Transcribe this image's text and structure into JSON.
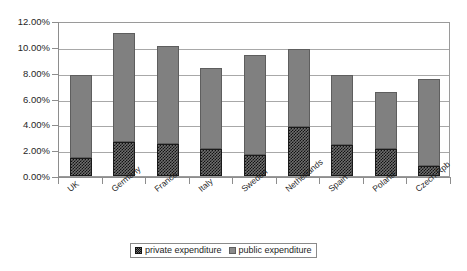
{
  "chart_data": {
    "type": "bar",
    "stacked": true,
    "title": "",
    "subtitle": "",
    "xlabel": "",
    "ylabel": "",
    "ylim": [
      0,
      12
    ],
    "ytick_labels": [
      "0.00%",
      "2.00%",
      "4.00%",
      "6.00%",
      "8.00%",
      "10.00%",
      "12.00%"
    ],
    "ytick_values": [
      0,
      2,
      4,
      6,
      8,
      10,
      12
    ],
    "grid": true,
    "legend_position": "bottom",
    "categories": [
      "UK",
      "Germany",
      "France",
      "Italy",
      "Sweden",
      "Netherlands",
      "Spain",
      "Poland",
      "Czech Rpb"
    ],
    "series": [
      {
        "name": "private expenditure",
        "color": "#1a1a1a",
        "pattern": "checkered",
        "values": [
          1.4,
          2.6,
          2.5,
          2.1,
          1.6,
          3.8,
          2.4,
          2.1,
          0.8
        ]
      },
      {
        "name": "public expenditure",
        "color": "#808080",
        "pattern": "solid",
        "values": [
          6.4,
          8.5,
          7.6,
          6.3,
          7.8,
          6.0,
          5.4,
          4.4,
          6.7
        ]
      }
    ],
    "totals": [
      7.8,
      11.1,
      10.1,
      8.4,
      9.4,
      9.8,
      7.8,
      6.5,
      7.5
    ]
  },
  "legend": {
    "items": [
      {
        "label": "private expenditure"
      },
      {
        "label": "public expenditure"
      }
    ]
  }
}
